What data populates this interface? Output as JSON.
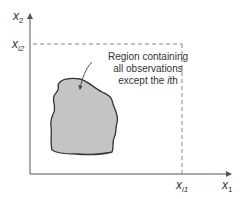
{
  "diagram": {
    "axes": {
      "x_label": {
        "base": "x",
        "sub": "1"
      },
      "y_label": {
        "base": "x",
        "sub": "2"
      }
    },
    "markers": {
      "x_marker": {
        "base": "x",
        "sub": "i1"
      },
      "y_marker": {
        "base": "x",
        "sub": "i2"
      }
    },
    "annotation": {
      "line1": "Region containing",
      "line2": "all observations",
      "line3_prefix": "except the ",
      "line3_italic": "i",
      "line3_suffix": "th"
    },
    "colors": {
      "axis": "#555555",
      "dashed": "#888888",
      "region_fill": "#c4c4c4",
      "region_stroke": "#333333",
      "text": "#333333"
    }
  }
}
